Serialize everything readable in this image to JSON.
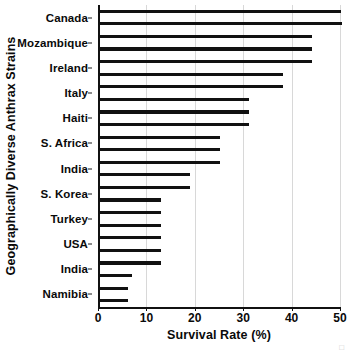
{
  "chart_data": {
    "type": "bar",
    "orientation": "horizontal",
    "title": "",
    "xlabel": "Survival Rate (%)",
    "ylabel": "Geographically Diverse Anthrax Strains",
    "xlim": [
      0,
      50
    ],
    "xticks": [
      0,
      10,
      20,
      30,
      40,
      50
    ],
    "xticklabels": [
      "0",
      "10",
      "20",
      "30",
      "40",
      "50"
    ],
    "grid": true,
    "grid_axis": "x",
    "legend": false,
    "bar_color": "#111111",
    "categories": [
      "Canada",
      "Mozambique",
      "Ireland",
      "Italy",
      "Haiti",
      "S. Africa",
      "India",
      "S. Korea",
      "Turkey",
      "USA",
      "India",
      "Namibia"
    ],
    "values": [
      50.3,
      44.2,
      38.2,
      31.2,
      25.2,
      19.1,
      13.1,
      13.1,
      13.1,
      13.1,
      6.5,
      6.1
    ],
    "bars": [
      {
        "label": "Canada",
        "value": 50.2
      },
      {
        "label": "Canada",
        "value": 50.4
      },
      {
        "label": "Mozambique",
        "value": 44.2
      },
      {
        "label": "Mozambique",
        "value": 44.2
      },
      {
        "label": "Ireland",
        "value": 44.2
      },
      {
        "label": "Ireland",
        "value": 38.2
      },
      {
        "label": "Italy",
        "value": 38.2
      },
      {
        "label": "Italy",
        "value": 31.2
      },
      {
        "label": "Haiti",
        "value": 31.2
      },
      {
        "label": "Haiti",
        "value": 31.2
      },
      {
        "label": "S. Africa",
        "value": 25.2
      },
      {
        "label": "S. Africa",
        "value": 25.2
      },
      {
        "label": "India",
        "value": 25.2
      },
      {
        "label": "India",
        "value": 19.1
      },
      {
        "label": "S. Korea",
        "value": 19.1
      },
      {
        "label": "S. Korea",
        "value": 13.1
      },
      {
        "label": "Turkey",
        "value": 13.1
      },
      {
        "label": "Turkey",
        "value": 13.1
      },
      {
        "label": "USA",
        "value": 13.1
      },
      {
        "label": "USA",
        "value": 13.1
      },
      {
        "label": "India",
        "value": 13.1
      },
      {
        "label": "India",
        "value": 7.0
      },
      {
        "label": "Namibia",
        "value": 6.1
      },
      {
        "label": "Namibia",
        "value": 6.1
      }
    ]
  }
}
